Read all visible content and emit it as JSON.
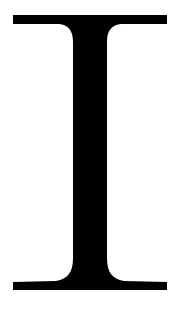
{
  "glyph": {
    "character": "I",
    "description": "Serif capital letter I (I-beam shape)",
    "color": "#000000",
    "background": "#ffffff"
  }
}
